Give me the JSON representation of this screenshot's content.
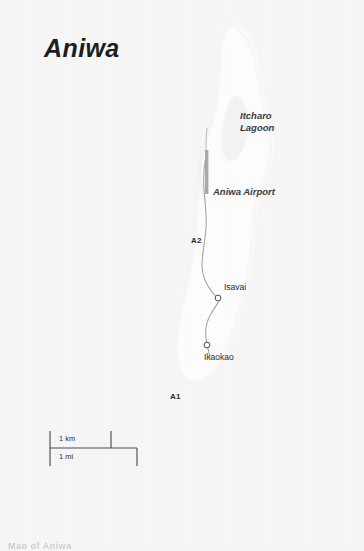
{
  "map": {
    "title": "Aniwa",
    "canvas": {
      "width": 364,
      "height": 551
    },
    "colors": {
      "paper": "#f7f7f7",
      "land": "#fcfcfc",
      "land_edge": "#e9e9e9",
      "sea": "#f2f2f2",
      "road": "#9a9a9a",
      "runway": "#a8a8a8",
      "text": "#2b2b2d",
      "title_text": "#1d1d1f",
      "scale_line": "#4a4a4c"
    },
    "labels": {
      "lagoon_line1": "Itcharo",
      "lagoon_line2": "Lagoon",
      "airport": "Aniwa Airport",
      "isavai": "Isavai",
      "ikaokao": "Ikaokao",
      "road_a2": "A2",
      "road_a1": "A1"
    },
    "scale_bar": {
      "km_label": "1 km",
      "mi_label": "1 mi",
      "km_length_px": 61,
      "mi_length_px": 87,
      "origin_x": 50,
      "origin_y": 432
    },
    "places": [
      {
        "name": "Isavai",
        "marker": "circle",
        "x": 218,
        "y": 298
      },
      {
        "name": "Ikaokao",
        "marker": "circle",
        "x": 207,
        "y": 345
      }
    ],
    "features": [
      {
        "name": "Itcharo Lagoon",
        "type": "lagoon"
      },
      {
        "name": "Aniwa Airport",
        "type": "airport",
        "runway_orientation": "north-south"
      }
    ],
    "roads": [
      {
        "name": "A2",
        "type": "minor-road"
      },
      {
        "name": "A1",
        "type": "minor-road"
      }
    ],
    "bottom_cut_text": "Map of Aniwa"
  }
}
